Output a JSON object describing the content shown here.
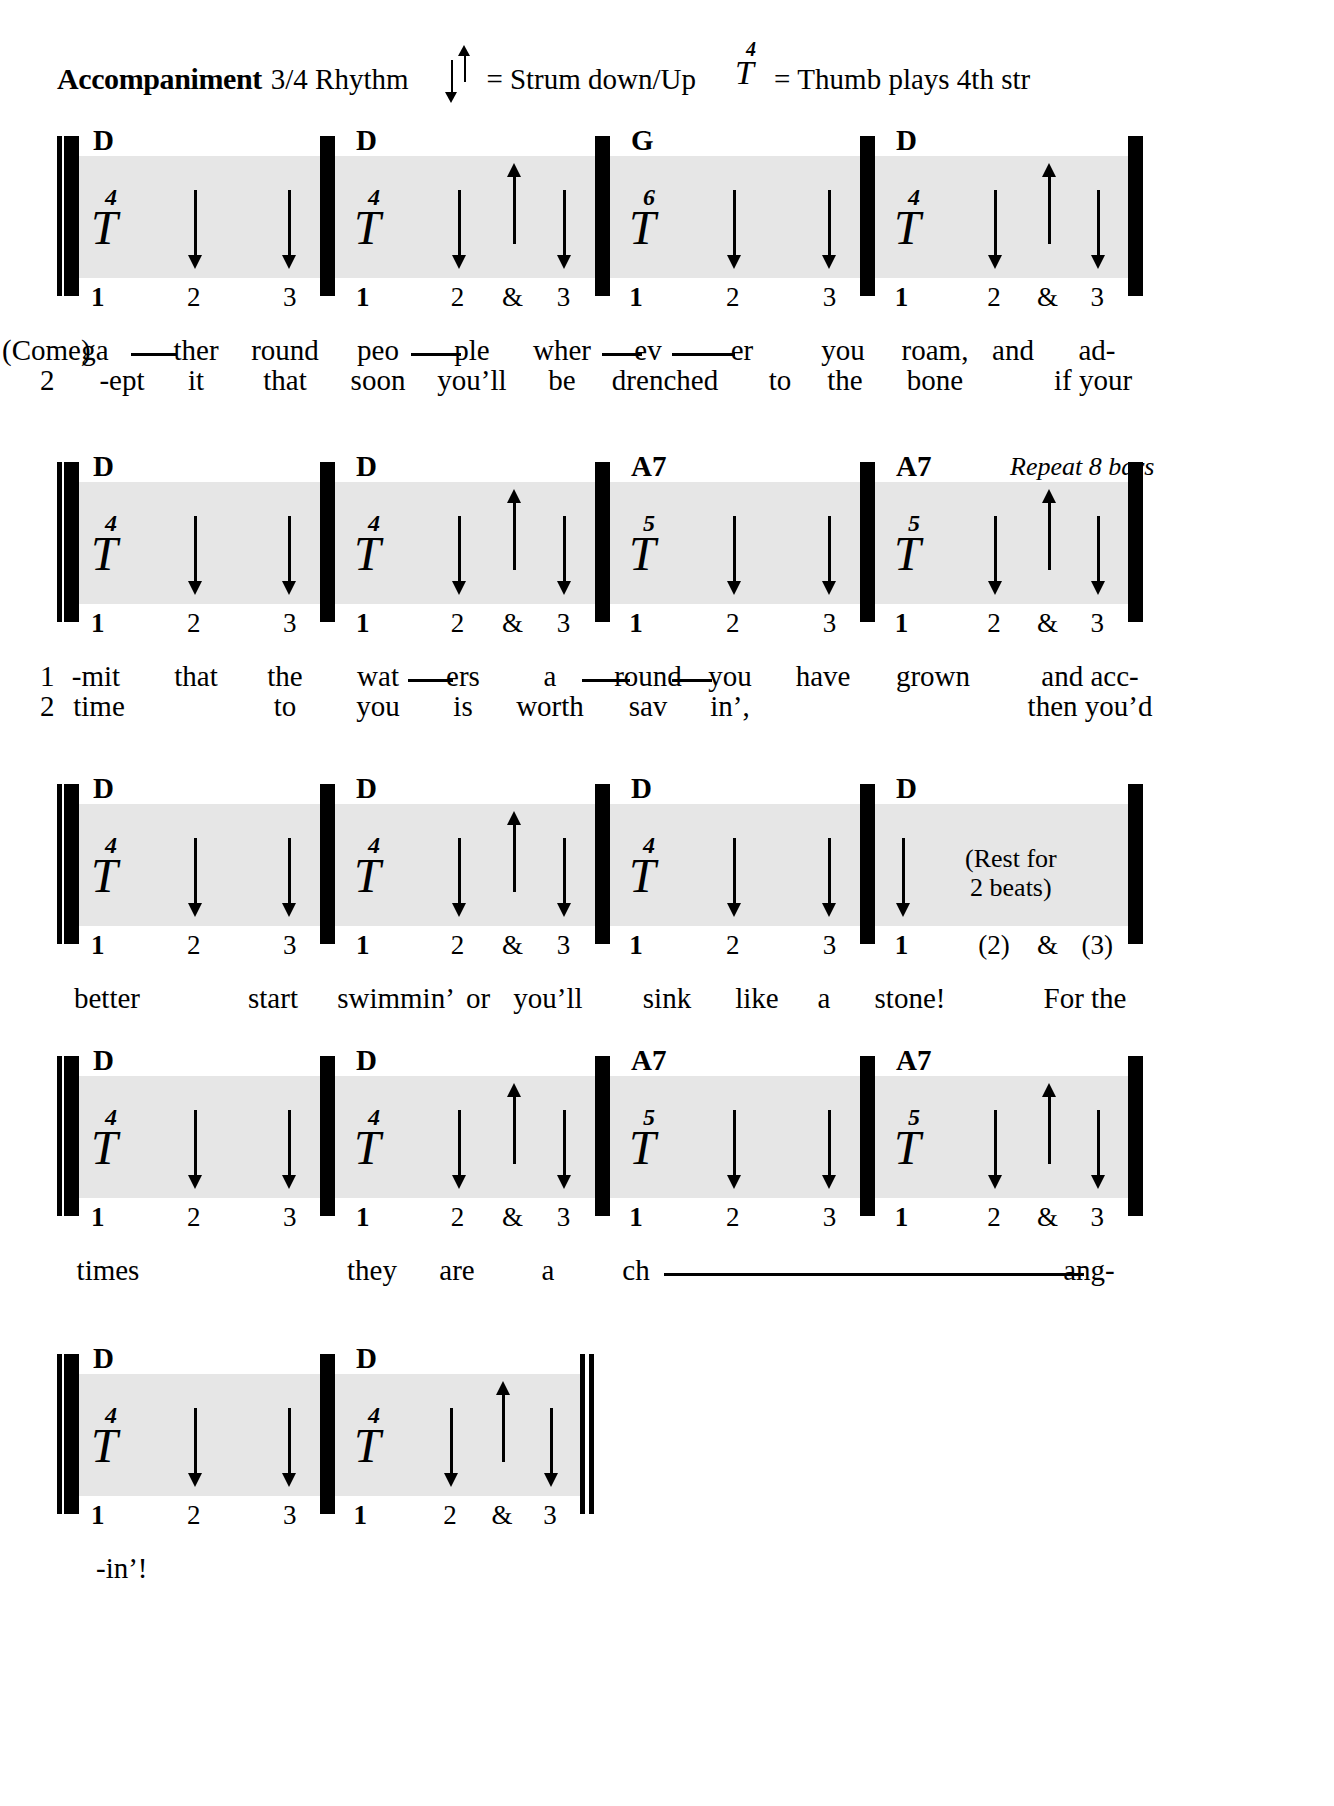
{
  "header": {
    "title": "Accompaniment",
    "rhythm": "3/4 Rhythm",
    "strum_equals": "=",
    "strum_text": "Strum down/Up",
    "thumb_string": "4",
    "thumb_letter": "T",
    "thumb_equals": "=",
    "thumb_text": "Thumb plays 4th str",
    "strum_down_icon": "arrow-down",
    "strum_up_icon": "arrow-up"
  },
  "systems": [
    {
      "measures": [
        {
          "chord": "D",
          "thumb_string": "4",
          "thumb_letter": "T",
          "arrows": [
            "down",
            "down"
          ],
          "beats": [
            {
              "label": "1",
              "strong": true
            },
            {
              "label": "2",
              "strong": false
            },
            {
              "label": "3",
              "strong": false
            }
          ]
        },
        {
          "chord": "D",
          "thumb_string": "4",
          "thumb_letter": "T",
          "arrows": [
            "down",
            "up",
            "down"
          ],
          "beats": [
            {
              "label": "1",
              "strong": true
            },
            {
              "label": "2",
              "strong": false
            },
            {
              "label": "&",
              "strong": false
            },
            {
              "label": "3",
              "strong": false
            }
          ]
        },
        {
          "chord": "G",
          "thumb_string": "6",
          "thumb_letter": "T",
          "arrows": [
            "down",
            "down"
          ],
          "beats": [
            {
              "label": "1",
              "strong": true
            },
            {
              "label": "2",
              "strong": false
            },
            {
              "label": "3",
              "strong": false
            }
          ]
        },
        {
          "chord": "D",
          "thumb_string": "4",
          "thumb_letter": "T",
          "arrows": [
            "down",
            "up",
            "down"
          ],
          "beats": [
            {
              "label": "1",
              "strong": true
            },
            {
              "label": "2",
              "strong": false
            },
            {
              "label": "&",
              "strong": false
            },
            {
              "label": "3",
              "strong": false
            }
          ]
        }
      ],
      "annotation": "",
      "lyrics_1": [
        "(Come)",
        "ga",
        "ther",
        "round",
        "peo",
        "ple",
        "wher",
        "ev",
        "er",
        "you",
        "roam,",
        "and",
        "ad-"
      ],
      "lyrics_2": [
        "2",
        "-ept",
        "it",
        "that",
        "soon",
        "you’ll",
        "be",
        "drenched",
        "to",
        "the",
        "bone",
        "",
        "if your"
      ]
    },
    {
      "measures": [
        {
          "chord": "D",
          "thumb_string": "4",
          "thumb_letter": "T",
          "arrows": [
            "down",
            "down"
          ],
          "beats": [
            {
              "label": "1",
              "strong": true
            },
            {
              "label": "2",
              "strong": false
            },
            {
              "label": "3",
              "strong": false
            }
          ]
        },
        {
          "chord": "D",
          "thumb_string": "4",
          "thumb_letter": "T",
          "arrows": [
            "down",
            "up",
            "down"
          ],
          "beats": [
            {
              "label": "1",
              "strong": true
            },
            {
              "label": "2",
              "strong": false
            },
            {
              "label": "&",
              "strong": false
            },
            {
              "label": "3",
              "strong": false
            }
          ]
        },
        {
          "chord": "A7",
          "thumb_string": "5",
          "thumb_letter": "T",
          "arrows": [
            "down",
            "down"
          ],
          "beats": [
            {
              "label": "1",
              "strong": true
            },
            {
              "label": "2",
              "strong": false
            },
            {
              "label": "3",
              "strong": false
            }
          ]
        },
        {
          "chord": "A7",
          "thumb_string": "5",
          "thumb_letter": "T",
          "arrows": [
            "down",
            "up",
            "down"
          ],
          "beats": [
            {
              "label": "1",
              "strong": true
            },
            {
              "label": "2",
              "strong": false
            },
            {
              "label": "&",
              "strong": false
            },
            {
              "label": "3",
              "strong": false
            }
          ]
        }
      ],
      "annotation": "Repeat 8 bars",
      "lyrics_1": [
        "1",
        "-mit",
        "that",
        "the",
        "wat",
        "ers",
        "a",
        "round",
        "you",
        "have",
        "grown",
        "",
        "and acc-"
      ],
      "lyrics_2": [
        "2",
        "time",
        "",
        "to",
        "you",
        "is",
        "worth",
        "sav",
        "in’,",
        "",
        "",
        "",
        "then you’d"
      ]
    },
    {
      "measures": [
        {
          "chord": "D",
          "thumb_string": "4",
          "thumb_letter": "T",
          "arrows": [
            "down",
            "down"
          ],
          "beats": [
            {
              "label": "1",
              "strong": true
            },
            {
              "label": "2",
              "strong": false
            },
            {
              "label": "3",
              "strong": false
            }
          ]
        },
        {
          "chord": "D",
          "thumb_string": "4",
          "thumb_letter": "T",
          "arrows": [
            "down",
            "up",
            "down"
          ],
          "beats": [
            {
              "label": "1",
              "strong": true
            },
            {
              "label": "2",
              "strong": false
            },
            {
              "label": "&",
              "strong": false
            },
            {
              "label": "3",
              "strong": false
            }
          ]
        },
        {
          "chord": "D",
          "thumb_string": "4",
          "thumb_letter": "T",
          "arrows": [
            "down",
            "down"
          ],
          "beats": [
            {
              "label": "1",
              "strong": true
            },
            {
              "label": "2",
              "strong": false
            },
            {
              "label": "3",
              "strong": false
            }
          ]
        },
        {
          "chord": "D",
          "thumb_string": "",
          "thumb_letter": "",
          "arrows": [
            "down"
          ],
          "beats": [
            {
              "label": "1",
              "strong": true
            },
            {
              "label": "(2)",
              "strong": false
            },
            {
              "label": "&",
              "strong": false
            },
            {
              "label": "(3)",
              "strong": false
            }
          ]
        }
      ],
      "annotation": "",
      "rest_note_line1": "(Rest for",
      "rest_note_line2": "2 beats)",
      "lyrics_1": [
        "better",
        "start",
        "swimmin’",
        "or",
        "you’ll",
        "sink",
        "like",
        "a",
        "stone!",
        "For the"
      ],
      "lyrics_2": []
    },
    {
      "measures": [
        {
          "chord": "D",
          "thumb_string": "4",
          "thumb_letter": "T",
          "arrows": [
            "down",
            "down"
          ],
          "beats": [
            {
              "label": "1",
              "strong": true
            },
            {
              "label": "2",
              "strong": false
            },
            {
              "label": "3",
              "strong": false
            }
          ]
        },
        {
          "chord": "D",
          "thumb_string": "4",
          "thumb_letter": "T",
          "arrows": [
            "down",
            "up",
            "down"
          ],
          "beats": [
            {
              "label": "1",
              "strong": true
            },
            {
              "label": "2",
              "strong": false
            },
            {
              "label": "&",
              "strong": false
            },
            {
              "label": "3",
              "strong": false
            }
          ]
        },
        {
          "chord": "A7",
          "thumb_string": "5",
          "thumb_letter": "T",
          "arrows": [
            "down",
            "down"
          ],
          "beats": [
            {
              "label": "1",
              "strong": true
            },
            {
              "label": "2",
              "strong": false
            },
            {
              "label": "3",
              "strong": false
            }
          ]
        },
        {
          "chord": "A7",
          "thumb_string": "5",
          "thumb_letter": "T",
          "arrows": [
            "down",
            "up",
            "down"
          ],
          "beats": [
            {
              "label": "1",
              "strong": true
            },
            {
              "label": "2",
              "strong": false
            },
            {
              "label": "&",
              "strong": false
            },
            {
              "label": "3",
              "strong": false
            }
          ]
        }
      ],
      "annotation": "",
      "lyrics_1": [
        "times",
        "they",
        "are",
        "a",
        "ch",
        "ang-"
      ],
      "lyrics_2": []
    },
    {
      "measures": [
        {
          "chord": "D",
          "thumb_string": "4",
          "thumb_letter": "T",
          "arrows": [
            "down",
            "down"
          ],
          "beats": [
            {
              "label": "1",
              "strong": true
            },
            {
              "label": "2",
              "strong": false
            },
            {
              "label": "3",
              "strong": false
            }
          ]
        },
        {
          "chord": "D",
          "thumb_string": "4",
          "thumb_letter": "T",
          "arrows": [
            "down",
            "up",
            "down"
          ],
          "beats": [
            {
              "label": "1",
              "strong": true
            },
            {
              "label": "2",
              "strong": false
            },
            {
              "label": "&",
              "strong": false
            },
            {
              "label": "3",
              "strong": false
            }
          ]
        }
      ],
      "annotation": "",
      "lyrics_1": [
        "-in’!"
      ],
      "lyrics_2": []
    }
  ],
  "colors": {
    "staff_band": "#e6e6e6",
    "ink": "#000000",
    "page": "#ffffff"
  }
}
